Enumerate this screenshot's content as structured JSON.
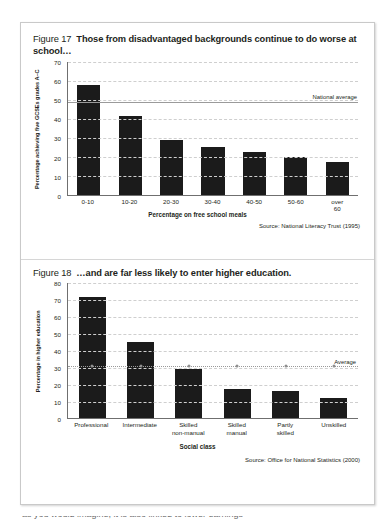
{
  "figure17": {
    "number": "Figure 17",
    "title": "Those from disadvantaged backgrounds continue to do worse at school…",
    "source": "Source: National Literacy Trust (1995)",
    "chart_data": {
      "type": "bar",
      "title": "Those from disadvantaged backgrounds continue to do worse at school…",
      "categories": [
        "0-10",
        "10-20",
        "20-30",
        "30-40",
        "40-50",
        "50-60",
        "over 60"
      ],
      "values": [
        58,
        41.5,
        29,
        25,
        22.5,
        20,
        17.5
      ],
      "xlabel": "Percentage on free school meals",
      "ylabel": "Percentage achieving five GCSEs grades A–C",
      "ylim": [
        0,
        70
      ],
      "yticks": [
        0,
        10,
        20,
        30,
        40,
        50,
        60,
        70
      ],
      "grid": true,
      "legend": "none",
      "annotations": [
        {
          "label": "National average",
          "type": "hline",
          "value": 49
        }
      ]
    }
  },
  "figure18": {
    "number": "Figure 18",
    "title": "…and are far less likely to enter higher education.",
    "source": "Source: Office for National Statistics (2000)",
    "chart_data": {
      "type": "bar",
      "title": "…and are far less likely to enter higher education.",
      "categories": [
        "Professional",
        "Intermediate",
        "Skilled non-manual",
        "Skilled manual",
        "Partly skilled",
        "Unskilled"
      ],
      "values": [
        72,
        45,
        29,
        17.5,
        16.5,
        12
      ],
      "xlabel": "Social class",
      "ylabel": "Percentage in higher education",
      "ylim": [
        0,
        80
      ],
      "yticks": [
        0,
        10,
        20,
        30,
        40,
        50,
        60,
        70,
        80
      ],
      "grid": true,
      "legend": "none",
      "annotations": [
        {
          "label": "Average",
          "type": "hline",
          "value": 31
        }
      ]
    }
  },
  "cutoff_text": "as you would imagine, it is also linked to lower earnings"
}
